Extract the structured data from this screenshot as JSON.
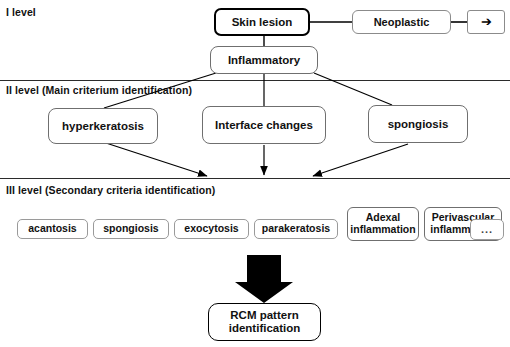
{
  "diagram": {
    "title_levels": {
      "level1": "I level",
      "level2": "II level (Main criterium identification)",
      "level3": "III level (Secondary criteria identification)"
    },
    "level1": {
      "root": "Skin lesion",
      "branch_neoplastic": "Neoplastic",
      "branch_continuation_icon": "right-arrow-glyph",
      "branch_continuation": "➔",
      "branch_inflammatory": "Inflammatory"
    },
    "level2": {
      "criteria": [
        "hyperkeratosis",
        "Interface changes",
        "spongiosis"
      ]
    },
    "level3": {
      "criteria": [
        "acantosis",
        "spongiosis",
        "exocytosis",
        "parakeratosis"
      ],
      "criteria_two_line": [
        {
          "line1": "Adexal",
          "line2": "inflammation"
        },
        {
          "line1": "Perivascular",
          "line2": "inflammation"
        }
      ],
      "ellipsis": "..."
    },
    "outcome": {
      "line1": "RCM pattern",
      "line2": "identification"
    },
    "colors": {
      "stroke": "#000000",
      "divider": "#2b2b2b",
      "thin_border": "#8b8b8b",
      "background": "#ffffff"
    }
  }
}
